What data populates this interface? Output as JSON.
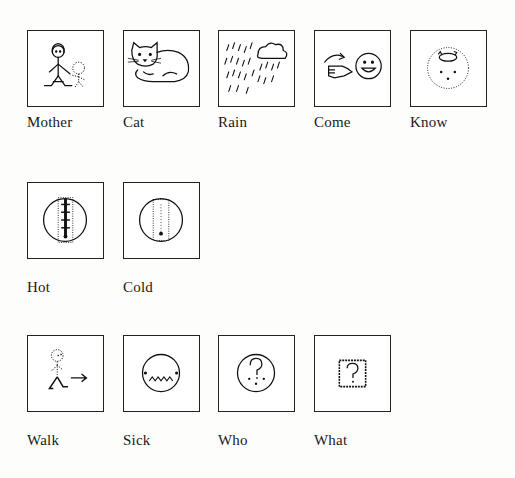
{
  "symbols": [
    {
      "word": "Mother",
      "icon": "mother-and-child-icon"
    },
    {
      "word": "Cat",
      "icon": "cat-icon"
    },
    {
      "word": "Rain",
      "icon": "rain-cloud-icon"
    },
    {
      "word": "Come",
      "icon": "beckoning-hand-icon"
    },
    {
      "word": "Know",
      "icon": "thinking-head-icon"
    },
    {
      "word": "Hot",
      "icon": "thermometer-hot-icon"
    },
    {
      "word": "Cold",
      "icon": "thermometer-cold-icon"
    },
    {
      "word": "Walk",
      "icon": "walking-person-icon"
    },
    {
      "word": "Sick",
      "icon": "sick-face-icon"
    },
    {
      "word": "Who",
      "icon": "question-face-icon"
    },
    {
      "word": "What",
      "icon": "question-box-icon"
    }
  ],
  "colors": {
    "ink": "#1a1a1a",
    "paper": "#fdfdfb"
  }
}
